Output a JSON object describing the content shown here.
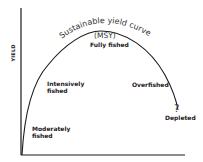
{
  "diagram": {
    "y_axis_label": "YIELD",
    "curve_title": "Sustainable yield curve",
    "curve_subtitle": "(MSY)",
    "stages": [
      {
        "label_line1": "Moderately",
        "label_line2": "fished"
      },
      {
        "label_line1": "Intensively",
        "label_line2": "fished"
      },
      {
        "label_line1": "Fully fished",
        "label_line2": ""
      },
      {
        "label_line1": "Overfished",
        "label_line2": ""
      },
      {
        "label_line1": "Depleted",
        "label_line2": ""
      }
    ],
    "uncertain_marker": "?",
    "colors": {
      "line": "#1a1a1a",
      "text": "#222222",
      "background": "#ffffff"
    }
  }
}
